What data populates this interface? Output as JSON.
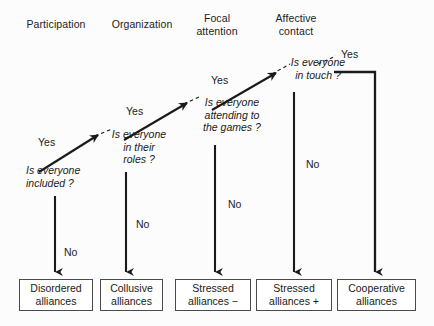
{
  "diagram": {
    "type": "decision-tree-flowchart",
    "columns": [
      {
        "label": "Participation"
      },
      {
        "label": "Organization"
      },
      {
        "label": "Focal\nattention"
      },
      {
        "label": "Affective\ncontact"
      }
    ],
    "questions": [
      {
        "id": "q1",
        "text": "Is everyone\nincluded ?"
      },
      {
        "id": "q2",
        "text": "Is everyone\nin their\nroles ?"
      },
      {
        "id": "q3",
        "text": "Is everyone\nattending to\nthe games ?"
      },
      {
        "id": "q4",
        "text": "Is everyone\nin touch ?"
      }
    ],
    "yes_labels": [
      {
        "id": "yes1",
        "text": "Yes"
      },
      {
        "id": "yes2",
        "text": "Yes"
      },
      {
        "id": "yes3",
        "text": "Yes"
      },
      {
        "id": "yes4",
        "text": "Yes"
      }
    ],
    "no_labels": [
      {
        "id": "no1",
        "text": "No"
      },
      {
        "id": "no2",
        "text": "No"
      },
      {
        "id": "no3",
        "text": "No"
      },
      {
        "id": "no4",
        "text": "No"
      }
    ],
    "outcomes": [
      {
        "id": "outcome1",
        "text": "Disordered\nalliances"
      },
      {
        "id": "outcome2",
        "text": "Collusive\nalliances"
      },
      {
        "id": "outcome3",
        "text": "Stressed\nalliances  −"
      },
      {
        "id": "outcome4",
        "text": "Stressed\nalliances  +"
      },
      {
        "id": "outcome5",
        "text": "Cooperative\nalliances"
      }
    ],
    "colors": {
      "stroke": "#1a1a1a",
      "box_border": "#4a4a4a",
      "background": "#fcfcfc",
      "text": "#1a1a1a"
    }
  }
}
